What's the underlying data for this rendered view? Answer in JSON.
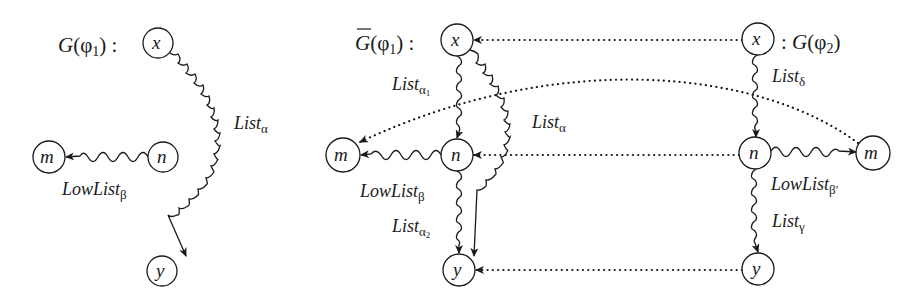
{
  "graphs": {
    "left": {
      "title": {
        "prefix": "G",
        "paren_open": "(",
        "phi": "φ",
        "phi_sub": "1",
        "paren_close": ")",
        "colon": " :"
      },
      "nodes": {
        "x": "x",
        "m": "m",
        "n": "n",
        "y": "y"
      },
      "edges": {
        "x_y": {
          "main": "List",
          "sub": "α"
        },
        "n_m": {
          "main": "LowList",
          "sub": "β"
        }
      }
    },
    "middle": {
      "title": {
        "prefix": "G",
        "overline": true,
        "paren_open": "(",
        "phi": "φ",
        "phi_sub": "1",
        "paren_close": ")",
        "colon": " :"
      },
      "nodes": {
        "x": "x",
        "m": "m",
        "n": "n",
        "y": "y"
      },
      "edges": {
        "x_n": {
          "main": "List",
          "sub": "α",
          "subsub": "1"
        },
        "x_y": {
          "main": "List",
          "sub": "α"
        },
        "n_m": {
          "main": "LowList",
          "sub": "β"
        },
        "n_y": {
          "main": "List",
          "sub": "α",
          "subsub": "2"
        }
      }
    },
    "right": {
      "title": {
        "colon": ": ",
        "prefix": "G",
        "paren_open": "(",
        "phi": "φ",
        "phi_sub": "2",
        "paren_close": ")"
      },
      "nodes": {
        "x": "x",
        "m": "m",
        "n": "n",
        "y": "y"
      },
      "edges": {
        "x_n": {
          "main": "List",
          "sub": "δ"
        },
        "n_m": {
          "main": "LowList",
          "sub": "β′"
        },
        "n_y": {
          "main": "List",
          "sub": "γ"
        }
      }
    }
  },
  "mappings": [
    {
      "from": "right.x",
      "to": "middle.x",
      "style": "dotted"
    },
    {
      "from": "right.m",
      "to": "middle.m",
      "style": "dotted"
    },
    {
      "from": "right.n",
      "to": "middle.n",
      "style": "dotted"
    },
    {
      "from": "right.y",
      "to": "middle.y",
      "style": "dotted"
    }
  ]
}
